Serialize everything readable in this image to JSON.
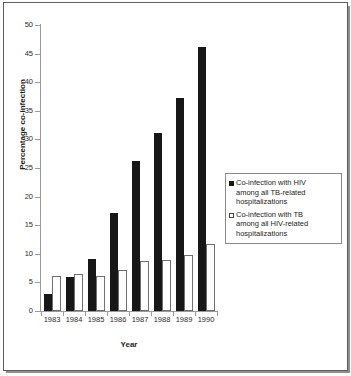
{
  "chart_data": {
    "type": "bar",
    "title": "",
    "subtitle": "",
    "xlabel": "Year",
    "ylabel": "Percentage co-infection",
    "categories": [
      "1983",
      "1984",
      "1985",
      "1986",
      "1987",
      "1988",
      "1989",
      "1990"
    ],
    "series": [
      {
        "name": "Co-infection with HIV among all TB-related hospitalizations",
        "legend_label_line1": "Co-infection with HIV",
        "legend_label_line2": "among all TB-related",
        "legend_label_line3": "hospitalizations",
        "color": "#171717",
        "style": "filled-black",
        "values": [
          3.0,
          6.0,
          9.1,
          17.2,
          26.2,
          31.2,
          37.2,
          46.2
        ]
      },
      {
        "name": "Co-infection with TB among all HIV-related hospitalizations",
        "legend_label_line1": "Co-infection with TB",
        "legend_label_line2": "among all HIV-related",
        "legend_label_line3": "hospitalizations",
        "color": "#ffffff",
        "style": "open-white",
        "values": [
          6.1,
          6.4,
          6.2,
          7.1,
          8.8,
          9.0,
          9.8,
          11.8
        ]
      }
    ],
    "ylim": [
      0,
      50
    ],
    "yticks": [
      0,
      5,
      10,
      15,
      20,
      25,
      30,
      35,
      40,
      45,
      50
    ],
    "ytick_labels": [
      "0",
      "5",
      "10",
      "15",
      "20",
      "25",
      "30",
      "35",
      "40",
      "45",
      "50"
    ],
    "grid": false,
    "legend_position": "right-middle",
    "annotations": []
  },
  "axes": {
    "y_title": "Percentage co-infection",
    "x_title": "Year"
  },
  "legend": {
    "entries": [
      {
        "swatch": "filled-square-black",
        "line1": "Co-infection with HIV",
        "line2": "among all TB-related",
        "line3": "hospitalizations"
      },
      {
        "swatch": "open-square-white",
        "line1": "Co-infection with TB",
        "line2": "among all HIV-related",
        "line3": "hospitalizations"
      }
    ]
  },
  "colors": {
    "series_hiv": "#171717",
    "series_tb": "#ffffff",
    "axis": "#9a9a9a",
    "frame": "#5d5d5d",
    "text": "#1d1d1d"
  }
}
